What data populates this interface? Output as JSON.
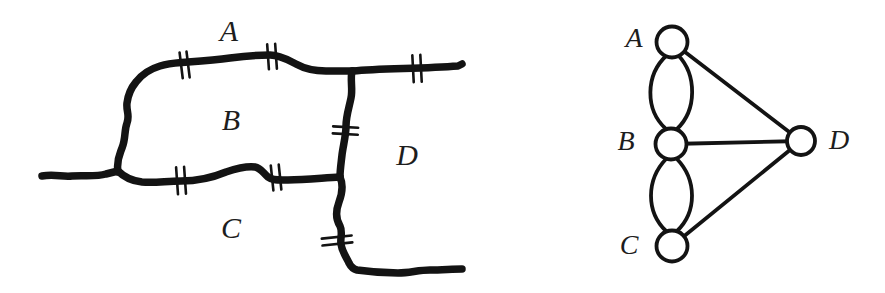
{
  "figure_type": "konigsberg-bridges-map-and-multigraph",
  "colors": {
    "background": "#ffffff",
    "ink": "#131313",
    "label": "#1d1d1d"
  },
  "map": {
    "region_labels": {
      "A": "A",
      "B": "B",
      "C": "C",
      "D": "D"
    },
    "bridge_count": 7,
    "bridges": [
      {
        "between": [
          "A",
          "B"
        ],
        "count": 2
      },
      {
        "between": [
          "B",
          "C"
        ],
        "count": 2
      },
      {
        "between": [
          "A",
          "D"
        ],
        "count": 1
      },
      {
        "between": [
          "B",
          "D"
        ],
        "count": 1
      },
      {
        "between": [
          "C",
          "D"
        ],
        "count": 1
      }
    ]
  },
  "graph": {
    "vertex_labels": {
      "A": "A",
      "B": "B",
      "C": "C",
      "D": "D"
    },
    "edges": [
      [
        "A",
        "B"
      ],
      [
        "A",
        "B"
      ],
      [
        "B",
        "C"
      ],
      [
        "B",
        "C"
      ],
      [
        "A",
        "D"
      ],
      [
        "B",
        "D"
      ],
      [
        "C",
        "D"
      ]
    ]
  }
}
